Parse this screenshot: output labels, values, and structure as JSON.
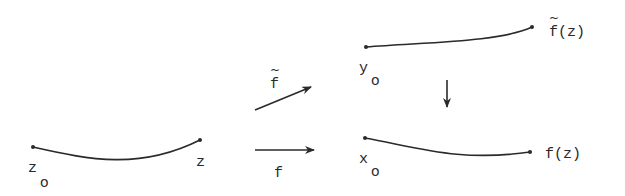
{
  "diagram": {
    "type": "commutative-lifting-diagram",
    "colors": {
      "ink": "#2a2a2a",
      "background": "#ffffff"
    },
    "curves": [
      {
        "id": "domain-path",
        "start_label": "z",
        "start_subscript": "o",
        "end_label": "z"
      },
      {
        "id": "lifted-path",
        "start_label": "y",
        "start_subscript": "o",
        "end_label": "f(z)",
        "end_label_tilde": "~"
      },
      {
        "id": "image-path",
        "start_label": "x",
        "start_subscript": "o",
        "end_label": "f(z)"
      }
    ],
    "arrows": [
      {
        "id": "lift-map",
        "label": "f",
        "label_tilde": "~"
      },
      {
        "id": "map-f",
        "label": "f"
      },
      {
        "id": "projection",
        "label": ""
      }
    ]
  }
}
